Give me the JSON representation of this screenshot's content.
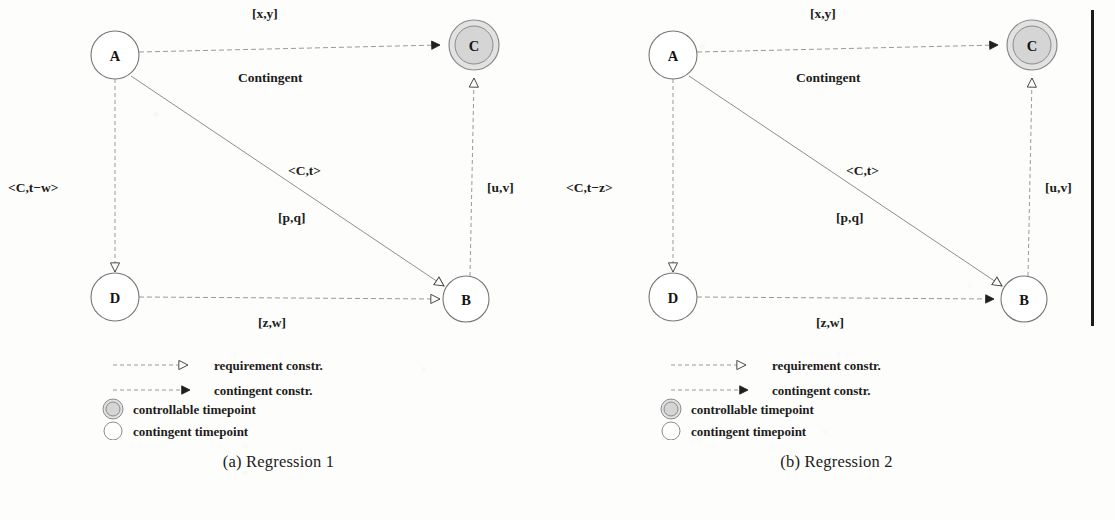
{
  "figure": {
    "background_color": "#fdfdfb",
    "ink_color": "#2b2b2b",
    "node_fill_controllable": "#d8d8d8",
    "node_fill_contingent": "#ffffff"
  },
  "divider": {
    "name": "vertical-rule",
    "color": "#1a1a1a"
  },
  "panels": [
    {
      "id": "regression-1",
      "caption": "(a) Regression 1",
      "nodes": [
        {
          "id": "A",
          "label": "A",
          "type": "contingent-timepoint",
          "x": 115,
          "y": 55
        },
        {
          "id": "C",
          "label": "C",
          "type": "controllable-timepoint",
          "x": 474,
          "y": 45
        },
        {
          "id": "D",
          "label": "D",
          "type": "contingent-timepoint",
          "x": 115,
          "y": 297
        },
        {
          "id": "B",
          "label": "B",
          "type": "contingent-timepoint",
          "x": 466,
          "y": 299
        }
      ],
      "edges": [
        {
          "id": "A-C",
          "from": "A",
          "to": "C",
          "kind": "contingent",
          "arrow": "filled",
          "label_above": "[x,y]",
          "label_below": "Contingent"
        },
        {
          "id": "A-B",
          "from": "A",
          "to": "B",
          "kind": "requirement",
          "arrow": "hollow",
          "label_above": "<C,t>",
          "label_below": "[p,q]"
        },
        {
          "id": "A-D",
          "from": "A",
          "to": "D",
          "kind": "requirement",
          "arrow": "hollow",
          "label_above": "<C,t−w>",
          "label_below": ""
        },
        {
          "id": "B-C",
          "from": "B",
          "to": "C",
          "kind": "requirement",
          "arrow": "hollow",
          "label_above": "[u,v]",
          "label_below": ""
        },
        {
          "id": "D-B",
          "from": "D",
          "to": "B",
          "kind": "requirement",
          "arrow": "hollow",
          "label_above": "[z,w]",
          "label_below": ""
        }
      ]
    },
    {
      "id": "regression-2",
      "caption": "(b) Regression 2",
      "nodes": [
        {
          "id": "A",
          "label": "A",
          "type": "contingent-timepoint",
          "x": 115,
          "y": 55
        },
        {
          "id": "C",
          "label": "C",
          "type": "controllable-timepoint",
          "x": 474,
          "y": 45
        },
        {
          "id": "D",
          "label": "D",
          "type": "contingent-timepoint",
          "x": 115,
          "y": 297
        },
        {
          "id": "B",
          "label": "B",
          "type": "contingent-timepoint",
          "x": 466,
          "y": 299
        }
      ],
      "edges": [
        {
          "id": "A-C",
          "from": "A",
          "to": "C",
          "kind": "contingent",
          "arrow": "filled",
          "label_above": "[x,y]",
          "label_below": "Contingent"
        },
        {
          "id": "A-B",
          "from": "A",
          "to": "B",
          "kind": "requirement",
          "arrow": "hollow",
          "label_above": "<C,t>",
          "label_below": "[p,q]"
        },
        {
          "id": "A-D",
          "from": "A",
          "to": "D",
          "kind": "requirement",
          "arrow": "hollow",
          "label_above": "<C,t−z>",
          "label_below": ""
        },
        {
          "id": "B-C",
          "from": "B",
          "to": "C",
          "kind": "requirement",
          "arrow": "hollow",
          "label_above": "[u,v]",
          "label_below": ""
        },
        {
          "id": "D-B",
          "from": "D",
          "to": "B",
          "kind": "contingent",
          "arrow": "filled",
          "label_above": "[z,w]",
          "label_below": ""
        }
      ]
    }
  ],
  "legend": {
    "items": [
      {
        "marker": "dashed-hollow-arrow",
        "label": "requirement constr."
      },
      {
        "marker": "dashed-filled-arrow",
        "label": "contingent constr."
      },
      {
        "marker": "double-circle",
        "label": "controllable timepoint"
      },
      {
        "marker": "single-circle",
        "label": "contingent timepoint"
      }
    ]
  }
}
